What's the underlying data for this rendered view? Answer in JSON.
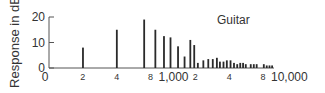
{
  "chart_data": {
    "type": "bar",
    "title": "Guitar",
    "xlabel": "",
    "ylabel": "Response in dB",
    "x_scale": "log",
    "xlim": [
      100,
      10000
    ],
    "ylim": [
      0,
      20
    ],
    "y_ticks": [
      0,
      10,
      20
    ],
    "y_tick_labels": [
      "0",
      "10",
      "20"
    ],
    "x_ticks": [
      100,
      200,
      400,
      800,
      1000,
      2000,
      4000,
      8000,
      10000
    ],
    "x_tick_labels": [
      "0",
      "2",
      "4",
      "8",
      "1,000",
      "2",
      "4",
      "8",
      "10,000"
    ],
    "grid": false,
    "legend": null,
    "bars": [
      {
        "x": 200,
        "y": 8
      },
      {
        "x": 400,
        "y": 15
      },
      {
        "x": 700,
        "y": 19
      },
      {
        "x": 880,
        "y": 15
      },
      {
        "x": 1050,
        "y": 12.5
      },
      {
        "x": 1200,
        "y": 12
      },
      {
        "x": 1400,
        "y": 8.5
      },
      {
        "x": 1600,
        "y": 4.5
      },
      {
        "x": 1800,
        "y": 11
      },
      {
        "x": 1950,
        "y": 9
      },
      {
        "x": 2100,
        "y": 2
      },
      {
        "x": 2350,
        "y": 3
      },
      {
        "x": 2600,
        "y": 3.5
      },
      {
        "x": 2850,
        "y": 3.5
      },
      {
        "x": 3100,
        "y": 4
      },
      {
        "x": 3300,
        "y": 2.5
      },
      {
        "x": 3550,
        "y": 2.5
      },
      {
        "x": 3800,
        "y": 3
      },
      {
        "x": 4100,
        "y": 3
      },
      {
        "x": 4400,
        "y": 2
      },
      {
        "x": 4700,
        "y": 1.5
      },
      {
        "x": 5000,
        "y": 2
      },
      {
        "x": 5300,
        "y": 2
      },
      {
        "x": 5600,
        "y": 1.5
      },
      {
        "x": 6200,
        "y": 1.5
      },
      {
        "x": 6600,
        "y": 1.5
      },
      {
        "x": 7000,
        "y": 1.5
      },
      {
        "x": 8100,
        "y": 1.5
      },
      {
        "x": 8600,
        "y": 1
      },
      {
        "x": 9100,
        "y": 1
      },
      {
        "x": 9600,
        "y": 1
      }
    ]
  },
  "chart": {
    "title": "Guitar",
    "ylabel": "Response in dB"
  },
  "colors": {
    "bar": "#2a2a2a",
    "axis": "#555555",
    "text": "#333333"
  }
}
